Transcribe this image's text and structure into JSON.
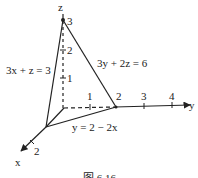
{
  "diagram": {
    "type": "3d-coordinate-region",
    "axes": {
      "x": {
        "label": "x",
        "ticks": [
          "2"
        ]
      },
      "y": {
        "label": "y",
        "ticks": [
          "1",
          "2",
          "3",
          "4"
        ]
      },
      "z": {
        "label": "z",
        "ticks": [
          "1",
          "2",
          "3"
        ]
      }
    },
    "equations": {
      "left_plane": "3x + z = 3",
      "right_plane": "3y + 2z = 6",
      "base_line": "y = 2 − 2x"
    },
    "caption": "图 6.16"
  }
}
